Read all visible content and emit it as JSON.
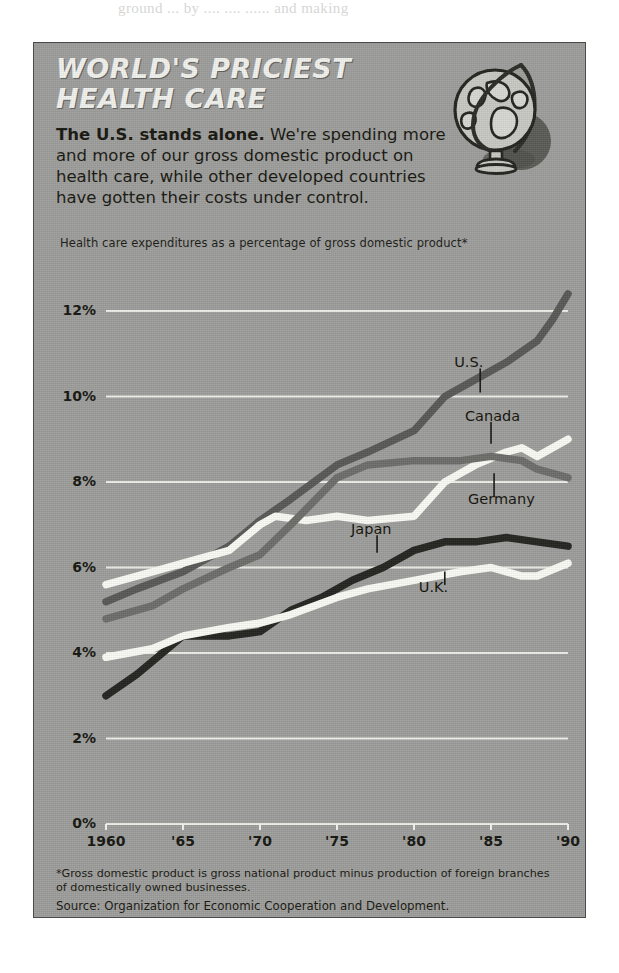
{
  "bleed_text": "ground  ... by  ....  ....  ...... and  making",
  "headline": {
    "line1": "WORLD'S PRICIEST",
    "line2": "HEALTH CARE"
  },
  "deck": {
    "lead": "The U.S. stands alone.",
    "rest": " We're spending more and more of our gross domestic product on health care, while other developed countries have gotten their costs under control."
  },
  "globe": {
    "icon": "globe-icon"
  },
  "footnote": "*Gross domestic product is gross national product minus production of foreign branches of domestically owned businesses.",
  "source": "Source: Organization for Economic Cooperation and Development.",
  "colors": {
    "panel_background": "#9e9e9c",
    "gridline": "#f4f4ef",
    "headline_text": "#f2f2ee",
    "body_text": "#16160f",
    "us_line": "#585856",
    "canada_line": "#fbfbf6",
    "germany_line": "#6d6d6a",
    "japan_line": "#232320",
    "uk_line": "#fbfbf6"
  },
  "chart_data": {
    "type": "line",
    "title": "WORLD'S PRICIEST HEALTH CARE",
    "subtitle": "Health care expenditures as a percentage of gross domestic product*",
    "xlabel": "",
    "ylabel": "",
    "xlim": [
      1960,
      1990
    ],
    "ylim": [
      0,
      12.8
    ],
    "yticks": [
      0,
      2,
      4,
      6,
      8,
      10,
      12
    ],
    "ytick_labels": [
      "0%",
      "2%",
      "4%",
      "6%",
      "8%",
      "10%",
      "12%"
    ],
    "xticks": [
      1960,
      1965,
      1970,
      1975,
      1980,
      1985,
      1990
    ],
    "xtick_labels": [
      "1960",
      "'65",
      "'70",
      "'75",
      "'80",
      "'85",
      "'90"
    ],
    "grid": "horizontal",
    "legend": "inline-labels",
    "series": [
      {
        "name": "U.S.",
        "color": "#585856",
        "label_x": 1984.3,
        "label_y": 10.75,
        "leader_to_y": 10.0,
        "x": [
          1960,
          1962,
          1965,
          1968,
          1970,
          1972,
          1975,
          1977,
          1980,
          1982,
          1984,
          1986,
          1988,
          1989,
          1990
        ],
        "y": [
          5.2,
          5.5,
          5.9,
          6.5,
          7.1,
          7.6,
          8.4,
          8.7,
          9.2,
          10.0,
          10.4,
          10.8,
          11.3,
          11.8,
          12.4
        ]
      },
      {
        "name": "Canada",
        "color": "#fbfbf6",
        "label_x": 1985.0,
        "label_y": 9.5,
        "leader_to_y": 8.8,
        "x": [
          1960,
          1963,
          1965,
          1968,
          1970,
          1971,
          1973,
          1975,
          1977,
          1980,
          1982,
          1984,
          1986,
          1987,
          1988,
          1990
        ],
        "y": [
          5.6,
          5.9,
          6.1,
          6.4,
          7.0,
          7.2,
          7.1,
          7.2,
          7.1,
          7.2,
          8.0,
          8.4,
          8.7,
          8.8,
          8.6,
          9.0
        ]
      },
      {
        "name": "Germany",
        "color": "#6d6d6a",
        "label_x": 1985.2,
        "label_y": 7.55,
        "leader_to_y": 8.3,
        "x": [
          1960,
          1963,
          1965,
          1968,
          1970,
          1972,
          1975,
          1977,
          1980,
          1983,
          1985,
          1987,
          1988,
          1990
        ],
        "y": [
          4.8,
          5.1,
          5.5,
          6.0,
          6.3,
          7.0,
          8.1,
          8.4,
          8.5,
          8.5,
          8.6,
          8.5,
          8.3,
          8.1
        ]
      },
      {
        "name": "Japan",
        "color": "#232320",
        "label_x": 1977.6,
        "label_y": 6.85,
        "leader_to_y": 6.25,
        "x": [
          1960,
          1962,
          1965,
          1967,
          1968,
          1970,
          1972,
          1974,
          1976,
          1978,
          1980,
          1982,
          1984,
          1986,
          1988,
          1990
        ],
        "y": [
          3.0,
          3.5,
          4.4,
          4.4,
          4.4,
          4.5,
          5.0,
          5.3,
          5.7,
          6.0,
          6.4,
          6.6,
          6.6,
          6.7,
          6.6,
          6.5
        ]
      },
      {
        "name": "U.K.",
        "color": "#fbfbf6",
        "label_x": 1982.0,
        "label_y": 5.5,
        "leader_to_y": 6.0,
        "x": [
          1960,
          1963,
          1965,
          1968,
          1970,
          1972,
          1975,
          1977,
          1980,
          1983,
          1985,
          1987,
          1988,
          1990
        ],
        "y": [
          3.9,
          4.1,
          4.4,
          4.6,
          4.7,
          4.9,
          5.3,
          5.5,
          5.7,
          5.9,
          6.0,
          5.8,
          5.8,
          6.1
        ]
      }
    ]
  }
}
